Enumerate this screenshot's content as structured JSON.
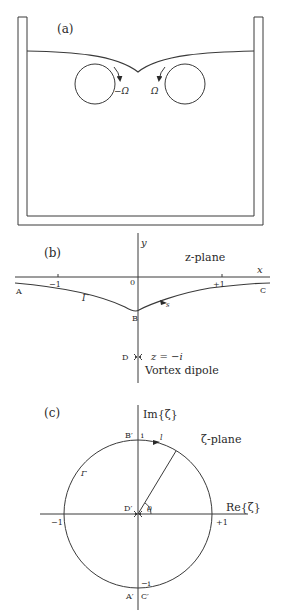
{
  "panel_a": {
    "label": "(a)",
    "left_vortex_label": "−Ω",
    "right_vortex_label": "Ω"
  },
  "panel_b": {
    "label": "(b)",
    "plane_label": "z-plane",
    "x_axis_label": "x",
    "y_axis_label": "y",
    "tick_minus_one": "−1",
    "tick_zero": "0",
    "tick_plus_one": "+1",
    "point_a": "A",
    "point_b": "B",
    "point_c": "C",
    "point_d": "D",
    "curve_label": "Γ",
    "arc_length_label": "s",
    "dipole_position": "z = −i",
    "dipole_label": "Vortex dipole"
  },
  "panel_c": {
    "label": "(c)",
    "plane_label": "ζ-plane",
    "im_axis_label": "Im{ζ}",
    "re_axis_label": "Re{ζ}",
    "tick_minus_one": "−1",
    "tick_plus_one": "+1",
    "tick_i": "i",
    "tick_minus_i": "−i",
    "point_a_prime": "A′",
    "point_b_prime": "B′",
    "point_c_prime": "C′",
    "point_d_prime": "D′",
    "curve_label": "Γ",
    "arc_label": "l",
    "angle_label": "θ"
  },
  "colors": {
    "ink": "#3a3a3a",
    "background": "#ffffff"
  }
}
